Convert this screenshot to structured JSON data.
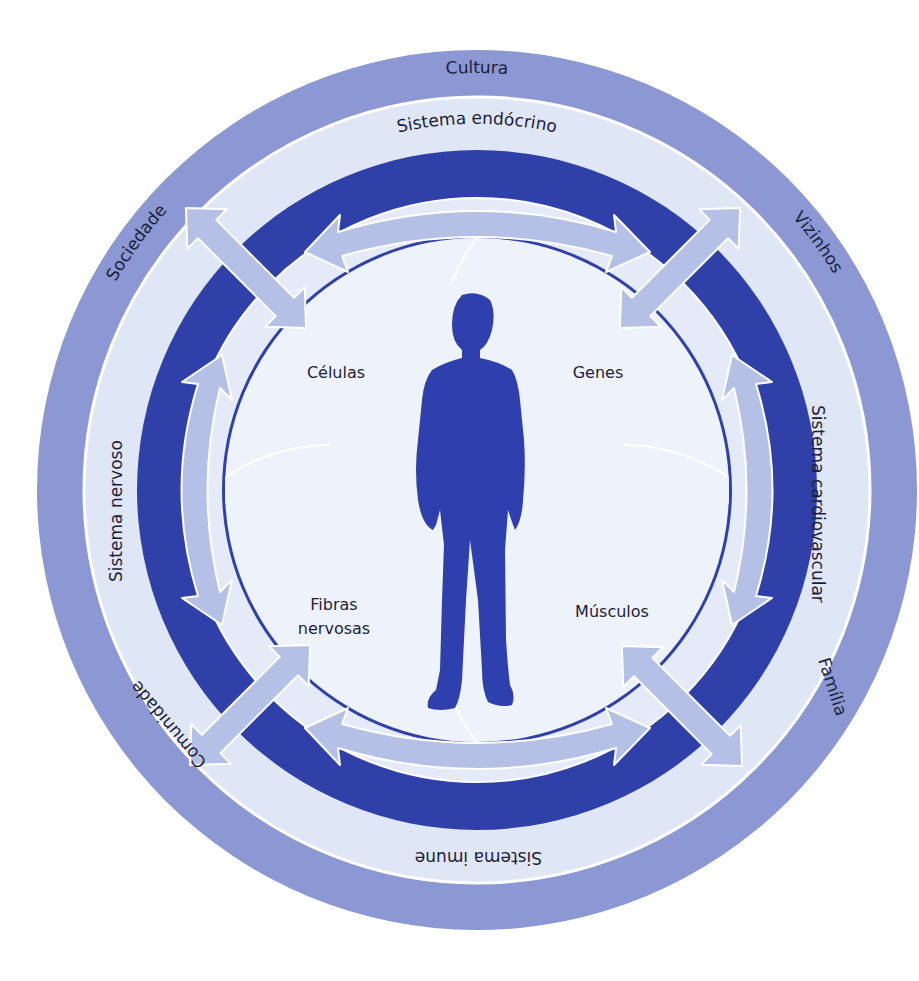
{
  "diagram": {
    "colors": {
      "outer_ring": "#8b98d4",
      "light_ring": "#dfe6f6",
      "dark_ring": "#2f40a8",
      "arrow": "#b4c0e6",
      "inner": "#eef2fb",
      "figure": "#2e3fae",
      "text": "#1e1e3a"
    },
    "outer_ring": {
      "labels": [
        "Cultura",
        "Vizinhos",
        "Família",
        "Comunidade",
        "Sociedade"
      ]
    },
    "middle_ring": {
      "labels": [
        "Sistema endócrino",
        "Sistema cardiovascular",
        "Sistema imune",
        "Sistema nervoso"
      ]
    },
    "inner_petals": {
      "labels": [
        "Células",
        "Genes",
        "Fibras",
        "nervosas",
        "Músculos"
      ]
    },
    "center": {
      "icon": "person-silhouette-icon"
    }
  }
}
